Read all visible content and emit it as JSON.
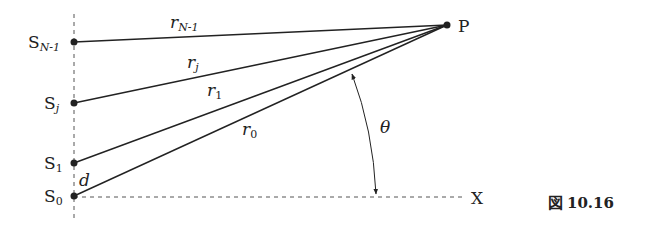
{
  "figure": {
    "caption": "図10.16",
    "caption_prefix": "図",
    "caption_number": "10.16"
  },
  "sources": [
    {
      "id": "S_{N-1}",
      "base": "S",
      "sub": "N-1",
      "x": 74,
      "y": 42
    },
    {
      "id": "S_j",
      "base": "S",
      "sub": "j",
      "x": 74,
      "y": 103
    },
    {
      "id": "S_1",
      "base": "S",
      "sub": "1",
      "x": 74,
      "y": 163
    },
    {
      "id": "S_0",
      "base": "S",
      "sub": "0",
      "x": 74,
      "y": 196
    }
  ],
  "point": {
    "label": "P",
    "x": 447,
    "y": 25
  },
  "rays": [
    {
      "base": "r",
      "sub": "N-1"
    },
    {
      "base": "r",
      "sub": "j"
    },
    {
      "base": "r",
      "sub": "1"
    },
    {
      "base": "r",
      "sub": "0"
    }
  ],
  "labels": {
    "spacing": "d",
    "angle": "θ",
    "axis": "X",
    "point": "P"
  },
  "colors": {
    "line": "#222222",
    "dashed": "#555555",
    "background": "#ffffff"
  }
}
